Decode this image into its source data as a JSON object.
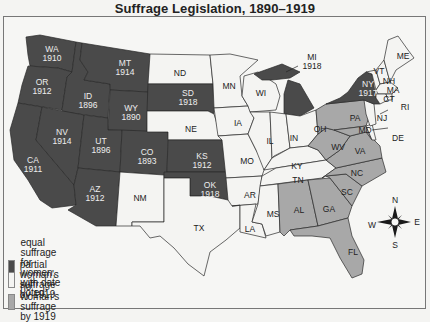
{
  "title": "Suffrage Legislation, 1890–1919",
  "colors": {
    "equal": "#4a4a4a",
    "partial": "#f4f4f2",
    "none": "#a8a8a8",
    "ocean": "#f6f6f4"
  },
  "legend": {
    "items": [
      {
        "key": "equal",
        "label_line1": "equal suffrage for women,",
        "label_line2": "with date voted"
      },
      {
        "key": "partial",
        "label_line1": "partial woman's suffrage by 1919",
        "label_line2": ""
      },
      {
        "key": "none",
        "label_line1": "no woman's suffrage by 1919",
        "label_line2": ""
      }
    ]
  },
  "compass": {
    "n": "N",
    "s": "S",
    "e": "E",
    "w": "W"
  },
  "states": [
    {
      "abbr": "WA",
      "year": "1910",
      "status": "equal"
    },
    {
      "abbr": "OR",
      "year": "1912",
      "status": "equal"
    },
    {
      "abbr": "CA",
      "year": "1911",
      "status": "equal"
    },
    {
      "abbr": "ID",
      "year": "1896",
      "status": "equal"
    },
    {
      "abbr": "NV",
      "year": "1914",
      "status": "equal"
    },
    {
      "abbr": "MT",
      "year": "1914",
      "status": "equal"
    },
    {
      "abbr": "WY",
      "year": "1890",
      "status": "equal"
    },
    {
      "abbr": "UT",
      "year": "1896",
      "status": "equal"
    },
    {
      "abbr": "AZ",
      "year": "1912",
      "status": "equal"
    },
    {
      "abbr": "CO",
      "year": "1893",
      "status": "equal"
    },
    {
      "abbr": "SD",
      "year": "1918",
      "status": "equal"
    },
    {
      "abbr": "KS",
      "year": "1912",
      "status": "equal"
    },
    {
      "abbr": "OK",
      "year": "1918",
      "status": "equal"
    },
    {
      "abbr": "MI",
      "year": "1918",
      "status": "equal"
    },
    {
      "abbr": "NY",
      "year": "1917",
      "status": "equal"
    },
    {
      "abbr": "ND",
      "year": "",
      "status": "partial"
    },
    {
      "abbr": "NE",
      "year": "",
      "status": "partial"
    },
    {
      "abbr": "NM",
      "year": "",
      "status": "partial"
    },
    {
      "abbr": "TX",
      "year": "",
      "status": "partial"
    },
    {
      "abbr": "MN",
      "year": "",
      "status": "partial"
    },
    {
      "abbr": "IA",
      "year": "",
      "status": "partial"
    },
    {
      "abbr": "MO",
      "year": "",
      "status": "partial"
    },
    {
      "abbr": "AR",
      "year": "",
      "status": "partial"
    },
    {
      "abbr": "LA",
      "year": "",
      "status": "partial"
    },
    {
      "abbr": "WI",
      "year": "",
      "status": "partial"
    },
    {
      "abbr": "IL",
      "year": "",
      "status": "partial"
    },
    {
      "abbr": "IN",
      "year": "",
      "status": "partial"
    },
    {
      "abbr": "OH",
      "year": "",
      "status": "partial"
    },
    {
      "abbr": "KY",
      "year": "",
      "status": "partial"
    },
    {
      "abbr": "TN",
      "year": "",
      "status": "partial"
    },
    {
      "abbr": "MS",
      "year": "",
      "status": "partial"
    },
    {
      "abbr": "ME",
      "year": "",
      "status": "partial"
    },
    {
      "abbr": "VT",
      "year": "",
      "status": "partial"
    },
    {
      "abbr": "NH",
      "year": "",
      "status": "partial"
    },
    {
      "abbr": "MA",
      "year": "",
      "status": "partial"
    },
    {
      "abbr": "CT",
      "year": "",
      "status": "partial"
    },
    {
      "abbr": "RI",
      "year": "",
      "status": "partial"
    },
    {
      "abbr": "NJ",
      "year": "",
      "status": "partial"
    },
    {
      "abbr": "DE",
      "year": "",
      "status": "partial"
    },
    {
      "abbr": "PA",
      "year": "",
      "status": "none"
    },
    {
      "abbr": "MD",
      "year": "",
      "status": "none"
    },
    {
      "abbr": "WV",
      "year": "",
      "status": "none"
    },
    {
      "abbr": "VA",
      "year": "",
      "status": "none"
    },
    {
      "abbr": "NC",
      "year": "",
      "status": "none"
    },
    {
      "abbr": "SC",
      "year": "",
      "status": "none"
    },
    {
      "abbr": "GA",
      "year": "",
      "status": "none"
    },
    {
      "abbr": "AL",
      "year": "",
      "status": "none"
    },
    {
      "abbr": "FL",
      "year": "",
      "status": "none"
    }
  ]
}
